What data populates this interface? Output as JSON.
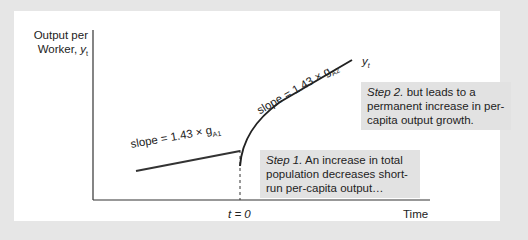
{
  "axes": {
    "y_label_line1": "Output per",
    "y_label_line2": "Worker, ",
    "y_label_var": "y",
    "y_label_sub": "t",
    "x_label": "Time",
    "x_tick": "t = 0"
  },
  "curve_label": {
    "var": "y",
    "sub": "t"
  },
  "slopes": {
    "before": {
      "text": "slope = 1.43 × g",
      "sub": "A1"
    },
    "after": {
      "text": "slope = 1.43 × g",
      "sub": "A2"
    }
  },
  "notes": {
    "step1": {
      "lead": "Step 1.",
      "text": " An increase in total population decreases short-run per-capita output…"
    },
    "step2": {
      "lead": "Step 2.",
      "text": " but leads to a permanent increase in per-capita output growth."
    }
  },
  "colors": {
    "background": "#e6e6e6",
    "panel": "#ffffff",
    "note": "#e2e2e2",
    "line": "#333333"
  }
}
